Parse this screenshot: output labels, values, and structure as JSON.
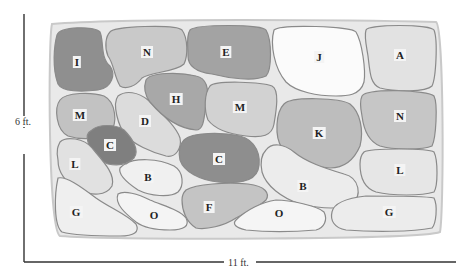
{
  "dimensions": {
    "height_label": "6 ft.",
    "width_label": "11 ft."
  },
  "beds": [
    {
      "id": "bed-I",
      "label": "I",
      "x": 77,
      "y": 62,
      "shade": "#8f8f8f",
      "path": "M57,35 C60,26 95,26 100,32 C104,40 100,58 110,66 C116,74 112,88 98,90 C82,92 62,92 58,84 C52,68 54,46 57,35 Z"
    },
    {
      "id": "bed-N1",
      "label": "N",
      "x": 147,
      "y": 52,
      "shade": "#c9c9c9",
      "path": "M110,32 C112,26 176,24 182,30 C188,38 188,56 184,64 C176,72 150,72 142,78 C136,86 126,90 120,86 C114,76 114,64 108,56 C104,46 106,36 110,32 Z"
    },
    {
      "id": "bed-E",
      "label": "E",
      "x": 226,
      "y": 52,
      "shade": "#a3a3a3",
      "path": "M190,30 C196,24 262,24 266,30 C272,40 272,70 266,76 C254,82 228,78 212,74 C196,72 188,66 188,56 C188,46 186,36 190,30 Z"
    },
    {
      "id": "bed-J",
      "label": "J",
      "x": 319,
      "y": 57,
      "shade": "#fbfbfb",
      "path": "M274,30 C280,24 352,26 356,32 C362,42 366,70 364,82 C360,96 346,96 336,96 C318,96 296,92 286,82 C274,68 270,44 274,30 Z"
    },
    {
      "id": "bed-A",
      "label": "A",
      "x": 400,
      "y": 55,
      "shade": "#e2e2e2",
      "path": "M366,30 C368,24 430,24 434,30 C438,40 436,78 432,86 C426,92 396,92 380,88 C370,84 370,72 368,56 C366,44 364,36 366,30 Z"
    },
    {
      "id": "bed-M1",
      "label": "M",
      "x": 80,
      "y": 115,
      "shade": "#c2c2c2",
      "path": "M60,100 C66,92 92,92 104,96 C116,102 118,124 110,132 C100,140 80,140 68,136 C56,130 54,108 60,100 Z"
    },
    {
      "id": "bed-D",
      "label": "D",
      "x": 145,
      "y": 121,
      "shade": "#dcdcdc",
      "path": "M118,96 C126,90 138,92 148,100 C160,112 176,126 180,138 C182,148 176,158 166,156 C150,152 134,144 126,136 C118,126 112,104 118,96 Z"
    },
    {
      "id": "bed-H",
      "label": "H",
      "x": 176,
      "y": 99,
      "shade": "#a8a8a8",
      "path": "M146,80 C150,72 180,72 196,76 C206,78 210,88 206,104 C204,118 204,130 196,130 C176,128 160,114 150,102 C144,94 144,86 146,80 Z"
    },
    {
      "id": "bed-M2",
      "label": "M",
      "x": 240,
      "y": 107,
      "shade": "#d2d2d2",
      "path": "M210,86 C216,80 262,82 272,86 C280,90 276,112 274,124 C272,136 262,138 246,136 C228,134 214,128 208,120 C204,110 204,94 210,86 Z"
    },
    {
      "id": "bed-K",
      "label": "K",
      "x": 319,
      "y": 133,
      "shade": "#bdbdbd",
      "path": "M284,104 C292,96 340,98 350,104 C360,112 364,130 360,146 C354,160 344,168 330,168 C306,166 290,158 282,148 C274,136 276,112 284,104 Z"
    },
    {
      "id": "bed-N2",
      "label": "N",
      "x": 400,
      "y": 116,
      "shade": "#c6c6c6",
      "path": "M362,96 C368,88 428,90 434,96 C438,104 436,138 432,146 C424,150 392,150 380,146 C370,142 364,132 362,116 C360,106 360,100 362,96 Z"
    },
    {
      "id": "bed-C1",
      "label": "C",
      "x": 110,
      "y": 145,
      "shade": "#7f7f7f",
      "path": "M92,130 C98,124 116,124 124,130 C132,138 140,150 134,158 C128,164 118,166 108,164 C98,160 90,150 88,142 C86,136 88,132 92,130 Z"
    },
    {
      "id": "bed-C2",
      "label": "C",
      "x": 219,
      "y": 159,
      "shade": "#8e8e8e",
      "path": "M184,140 C192,132 222,132 240,136 C256,140 262,156 258,170 C254,182 236,184 218,182 C200,180 184,172 180,160 C178,152 180,144 184,140 Z"
    },
    {
      "id": "bed-L1",
      "label": "L",
      "x": 75,
      "y": 164,
      "shade": "#e1e1e1",
      "path": "M60,142 C66,136 84,138 92,148 C102,160 116,174 112,186 C106,196 92,196 80,190 C68,184 58,174 58,160 C56,150 58,146 60,142 Z"
    },
    {
      "id": "bed-B1",
      "label": "B",
      "x": 148,
      "y": 177,
      "shade": "#f0f0f0",
      "path": "M126,164 C134,158 158,158 174,166 C184,172 184,186 178,192 C170,198 150,196 138,190 C126,182 118,174 120,168 C122,166 124,164 126,164 Z"
    },
    {
      "id": "bed-B2",
      "label": "B",
      "x": 303,
      "y": 186,
      "shade": "#ececec",
      "path": "M266,150 C272,142 284,144 294,152 C306,162 324,168 344,174 C360,178 362,196 352,204 C340,210 318,208 300,204 C282,198 266,186 262,172 C260,162 262,154 266,150 Z"
    },
    {
      "id": "bed-L2",
      "label": "L",
      "x": 400,
      "y": 170,
      "shade": "#e6e6e6",
      "path": "M364,152 C370,148 428,148 434,152 C438,160 438,186 434,192 C422,196 392,196 376,192 C364,188 360,176 360,164 C360,158 362,154 364,152 Z"
    },
    {
      "id": "bed-G1",
      "label": "G",
      "x": 76,
      "y": 212,
      "shade": "#efefef",
      "path": "M58,178 C66,176 80,186 96,198 C110,208 126,214 136,224 C140,232 134,236 120,236 C100,236 76,236 62,232 C54,226 54,196 58,178 Z"
    },
    {
      "id": "bed-O1",
      "label": "O",
      "x": 154,
      "y": 215,
      "shade": "#f4f4f4",
      "path": "M118,194 C124,190 138,194 150,200 C164,206 180,210 186,218 C190,226 184,230 170,230 C156,230 144,228 136,222 C126,214 114,204 118,194 Z"
    },
    {
      "id": "bed-F",
      "label": "F",
      "x": 209,
      "y": 207,
      "shade": "#c4c4c4",
      "path": "M186,190 C196,184 226,182 248,184 C266,186 270,194 266,200 C258,208 246,212 236,218 C224,226 206,230 196,228 C186,222 182,210 182,200 C182,196 184,192 186,190 Z"
    },
    {
      "id": "bed-O2",
      "label": "O",
      "x": 279,
      "y": 213,
      "shade": "#f5f5f5",
      "path": "M236,220 C246,210 262,202 276,200 C290,200 318,206 324,212 C328,220 324,228 316,230 C292,232 266,232 246,230 C236,228 232,224 236,220 Z"
    },
    {
      "id": "bed-G2",
      "label": "G",
      "x": 389,
      "y": 212,
      "shade": "#ececec",
      "path": "M332,212 C334,202 348,198 366,196 C392,196 426,196 434,198 C438,206 436,224 432,228 C412,232 372,232 346,230 C334,228 330,220 332,212 Z"
    }
  ]
}
